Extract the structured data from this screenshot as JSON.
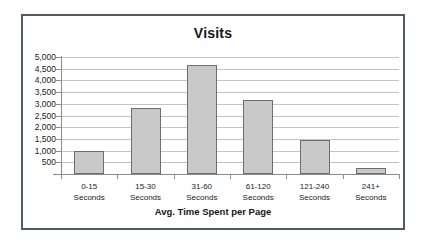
{
  "chart_data": {
    "type": "bar",
    "title": "Visits",
    "xlabel": "Avg. Time Spent per Page",
    "ylabel": "",
    "categories": [
      "0-15 Seconds",
      "15-30 Seconds",
      "31-60 Seconds",
      "61-120 Seconds",
      "121-240 Seconds",
      "241+ Seconds"
    ],
    "category_lines": [
      [
        "0-15",
        "Seconds"
      ],
      [
        "15-30",
        "Seconds"
      ],
      [
        "31-60",
        "Seconds"
      ],
      [
        "61-120",
        "Seconds"
      ],
      [
        "121-240",
        "Seconds"
      ],
      [
        "241+",
        "Seconds"
      ]
    ],
    "values": [
      1000,
      2800,
      4650,
      3150,
      1450,
      250
    ],
    "ylim": [
      0,
      5000
    ],
    "ytick_values": [
      5000,
      4500,
      4000,
      3500,
      3000,
      2500,
      2000,
      1500,
      1000,
      500,
      0
    ],
    "ytick_labels": [
      "5,000",
      "4,500",
      "4,000",
      "3,500",
      "3,000",
      "2,500",
      "2,000",
      "1,500",
      "1,000",
      "500",
      "-"
    ],
    "grid": true,
    "legend": false,
    "bar_fill_color": "#c9c9c9",
    "bar_border_color": "#6d6d6d",
    "gridline_color": "#c4c4c4",
    "axis_color": "#8c8c8c",
    "frame_border_color": "#555a5e",
    "background_color": "#ffffff",
    "text_color": "#161616"
  }
}
